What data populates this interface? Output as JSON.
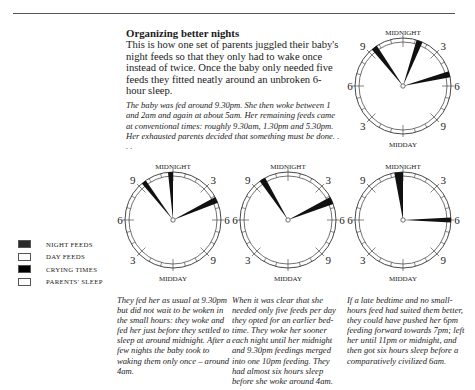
{
  "header": {
    "title": "Organizing better nights",
    "intro": "This is how one set of parents juggled their baby's night feeds so that they only had to wake once instead of twice. Once the baby only needed five feeds they fitted neatly around an unbroken 6-hour sleep.",
    "story": "The baby was fed around 9.30pm. She then woke between 1 and 2am and again at about 5am. Her remaining feeds came at conventional times: roughly 9.30am, 1.30pm and 5.30pm. Her exhausted parents decided that something must be done. . . ."
  },
  "clock_labels": {
    "top": "MIDNIGHT",
    "bottom": "MIDDAY",
    "left": "6",
    "right": "6",
    "upper_left": "9",
    "upper_right": "3",
    "lower_left": "3",
    "lower_right": "9"
  },
  "legend": [
    {
      "label": "NIGHT FEEDS",
      "color": "#2a2a2a"
    },
    {
      "label": "DAY FEEDS",
      "color": "#ffffff"
    },
    {
      "label": "CRYING TIMES",
      "color": "#000000"
    },
    {
      "label": "PARENTS' SLEEP",
      "color": "#ffffff"
    }
  ],
  "captions": [
    "They fed her as usual at 9.30pm but did not wait to be woken in the small hours: they woke and fed her just before they settled to sleep at around midnight. After a few nights the baby took to waking them only once – around 4am.",
    "When it was clear that she needed only five feeds per day they opted for an earlier bed-time. They woke her sooner each night until her midnight and 9.30pm feedings merged into one 10pm feeding. They had almost six hours sleep before she woke around 4am.",
    "If a late bedtime and no small-hours feed had suited them better, they could have pushed her 6pm feeding forward towards 7pm; left her until 11pm or midnight, and then got six hours sleep before a comparatively civilized 6am."
  ],
  "chart_data": [
    {
      "type": "pie",
      "title": "Original schedule",
      "clock": "24-hour, midnight at top",
      "night_feeds_hours": [
        [
          21.3,
          21.8
        ],
        [
          1.1,
          1.6
        ],
        [
          4.8,
          5.3
        ]
      ]
    },
    {
      "type": "pie",
      "title": "Step 1",
      "clock": "24-hour, midnight at top",
      "night_feeds_hours": [
        [
          21.3,
          21.7
        ],
        [
          23.6,
          24.0
        ],
        [
          4.1,
          4.6
        ]
      ]
    },
    {
      "type": "pie",
      "title": "Step 2",
      "clock": "24-hour, midnight at top",
      "night_feeds_hours": [
        [
          21.6,
          22.1
        ],
        [
          4.1,
          4.7
        ]
      ]
    },
    {
      "type": "pie",
      "title": "Alternative",
      "clock": "24-hour, midnight at top",
      "night_feeds_hours": [
        [
          23.3,
          24.0
        ],
        [
          5.8,
          6.2
        ]
      ]
    }
  ]
}
